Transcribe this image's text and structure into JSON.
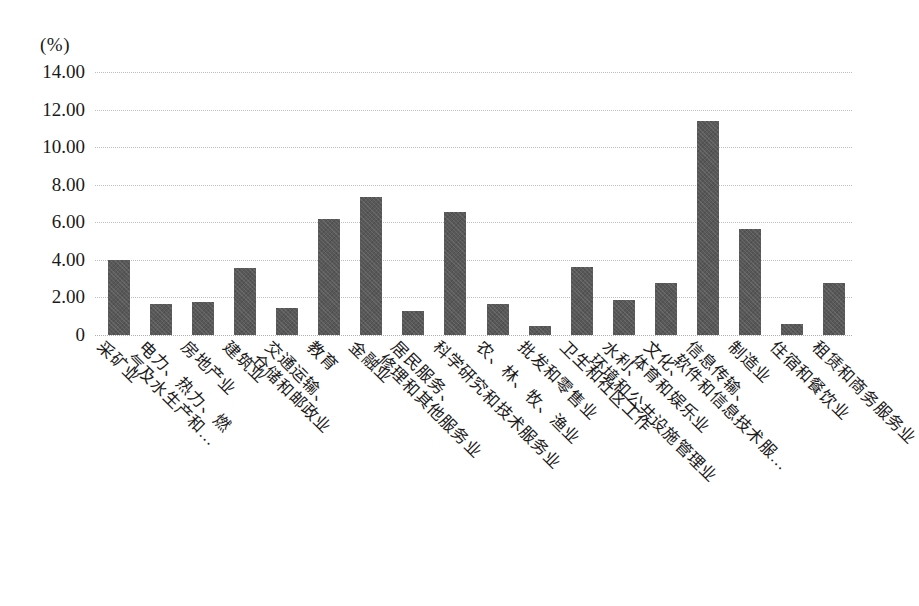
{
  "chart_data": {
    "type": "bar",
    "title": "",
    "subtitle": "",
    "xlabel": "",
    "ylabel": "(%)",
    "unit_label": "(%)",
    "ylim": [
      0,
      14
    ],
    "ytick_labels": [
      "14.00",
      "12.00",
      "10.00",
      "8.00",
      "6.00",
      "4.00",
      "2.00",
      "0"
    ],
    "ytick_values": [
      14,
      12,
      10,
      8,
      6,
      4,
      2,
      0
    ],
    "grid": true,
    "grid_axis": "y",
    "legend": "none",
    "bar_color": "#585858",
    "gridline_color": "#bdbdbd",
    "categories": [
      "采矿业",
      "电力、热力、燃气及水生产和…",
      "房地产业",
      "建筑业",
      "交通运输、仓储和邮政业",
      "教育",
      "金融业",
      "居民服务、修理和其他服务业",
      "科学研究和技术服务业",
      "农、林、牧、渔业",
      "批发和零售业",
      "卫生和社区工作",
      "水利、环境和公共设施管理业",
      "文化、体育和娱乐业",
      "信息传输、软件和信息技术服…",
      "制造业",
      "住宿和餐饮业",
      "租赁和商务服务业"
    ],
    "category_lines": [
      [
        "采矿业"
      ],
      [
        "电力、热力、燃",
        "气及水生产和…"
      ],
      [
        "房地产业"
      ],
      [
        "建筑业"
      ],
      [
        "交通运输、",
        "仓储和邮政业"
      ],
      [
        "教育"
      ],
      [
        "金融业"
      ],
      [
        "居民服务、",
        "修理和其他服务业"
      ],
      [
        "科学研究和技术服务业"
      ],
      [
        "农、林、牧、渔业"
      ],
      [
        "批发和零售业"
      ],
      [
        "卫生和社区工作"
      ],
      [
        "水利、",
        "环境和公共设施管理业"
      ],
      [
        "文化、",
        "体育和娱乐业"
      ],
      [
        "信息传输、",
        "软件和信息技术服…"
      ],
      [
        "制造业"
      ],
      [
        "住宿和餐饮业"
      ],
      [
        "租赁和商务服务业"
      ]
    ],
    "values": [
      4.0,
      1.65,
      1.75,
      3.55,
      1.45,
      6.15,
      7.35,
      1.3,
      6.55,
      1.65,
      0.5,
      3.6,
      1.85,
      2.75,
      11.4,
      5.65,
      0.6,
      2.75
    ]
  }
}
